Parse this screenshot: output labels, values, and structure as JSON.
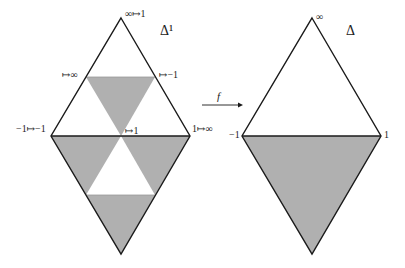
{
  "colors": {
    "stroke": "#1a1a1a",
    "shade": "#b0b0b0",
    "background": "#ffffff"
  },
  "left_diagram": {
    "title": "Δ¹",
    "labels": {
      "top": "∞↦1",
      "upper_left_mid": "↦∞",
      "upper_right_mid": "↦−1",
      "left": "−1↦−1",
      "right": "1↦∞",
      "center": "↦1"
    }
  },
  "arrow": {
    "label": "f"
  },
  "right_diagram": {
    "title": "Δ",
    "labels": {
      "top": "∞",
      "left": "−1",
      "right": "1"
    }
  }
}
